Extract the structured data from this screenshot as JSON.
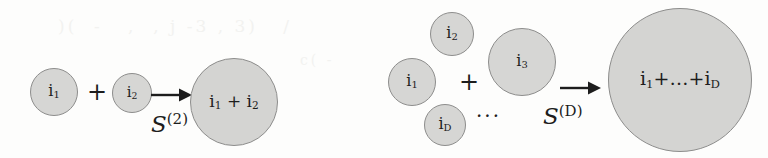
{
  "figure": {
    "type": "diagram",
    "background_color": "#fdfdfc",
    "circle_fill": "#d6d6d4",
    "circle_stroke": "#8d8d8c",
    "text_color": "#1d1d1d",
    "ghost_text": "bleed-through"
  },
  "panels": [
    {
      "id": "panel-left",
      "operator": {
        "symbol": "S",
        "superscript": "(2)"
      },
      "inputs": [
        {
          "id": "left-input-1",
          "base": "i",
          "sub": "1",
          "diameter": 48
        },
        {
          "id": "left-input-2",
          "base": "i",
          "sub": "2",
          "diameter": 40
        }
      ],
      "plus": "+",
      "output": {
        "id": "left-output",
        "terms": [
          "i1",
          "+",
          "i2"
        ],
        "diameter": 88
      }
    },
    {
      "id": "panel-right",
      "operator": {
        "symbol": "S",
        "superscript": "(D)"
      },
      "inputs": [
        {
          "id": "right-input-1",
          "base": "i",
          "sub": "1",
          "diameter": 48
        },
        {
          "id": "right-input-2",
          "base": "i",
          "sub": "2",
          "diameter": 44
        },
        {
          "id": "right-input-D",
          "base": "i",
          "sub": "D",
          "diameter": 42
        },
        {
          "id": "right-input-3",
          "base": "i",
          "sub": "3",
          "diameter": 68
        }
      ],
      "plus": "+",
      "ellipsis": "···",
      "output": {
        "id": "right-output",
        "terms": [
          "i1",
          "+",
          "...",
          "+",
          "iD"
        ],
        "diameter": 144
      }
    }
  ],
  "labels": {
    "i1": "i",
    "i2": "i",
    "i3": "i",
    "iD": "i",
    "sub1": "1",
    "sub2": "2",
    "sub3": "3",
    "subD": "D",
    "plus": "+",
    "ellipsis_mid": "···",
    "ellipsis_sum": "…",
    "operator_symbol": "S",
    "sup_2": "(2)",
    "sup_D": "(D)"
  }
}
